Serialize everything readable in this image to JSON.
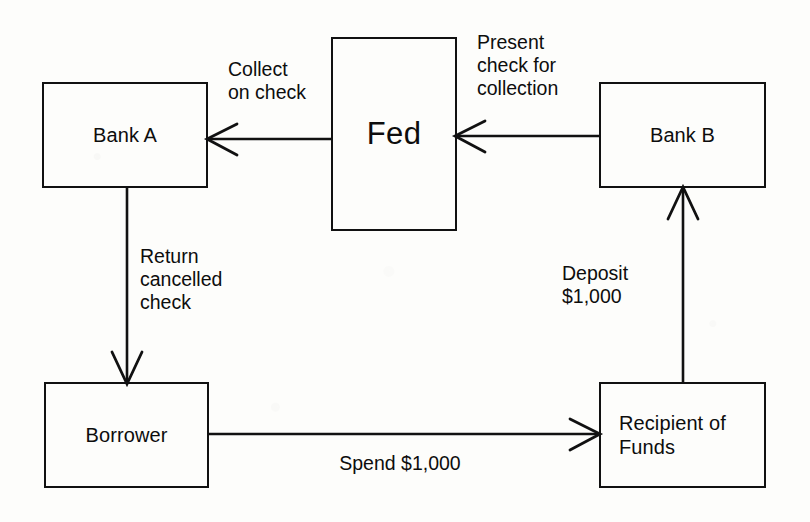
{
  "figure": {
    "kind": "flow-diagram",
    "background_color": "#fdfdfb",
    "ink_color": "#111111"
  },
  "nodes": [
    {
      "id": "bank-a",
      "label": "Bank A"
    },
    {
      "id": "fed",
      "label": "Fed"
    },
    {
      "id": "bank-b",
      "label": "Bank B"
    },
    {
      "id": "borrower",
      "label": "Borrower"
    },
    {
      "id": "recipient",
      "label": "Recipient of\nFunds"
    }
  ],
  "edges": [
    {
      "id": "fed-to-bank-a",
      "from": "fed",
      "to": "bank-a",
      "label": "Collect\non check"
    },
    {
      "id": "bank-b-to-fed",
      "from": "bank-b",
      "to": "fed",
      "label": "Present\ncheck for\ncollection"
    },
    {
      "id": "bank-a-to-borrower",
      "from": "bank-a",
      "to": "borrower",
      "label": "Return\ncancelled\ncheck"
    },
    {
      "id": "recipient-to-bank-b",
      "from": "recipient",
      "to": "bank-b",
      "label": "Deposit\n$1,000"
    },
    {
      "id": "borrower-to-recipient",
      "from": "borrower",
      "to": "recipient",
      "label": "Spend $1,000"
    }
  ]
}
